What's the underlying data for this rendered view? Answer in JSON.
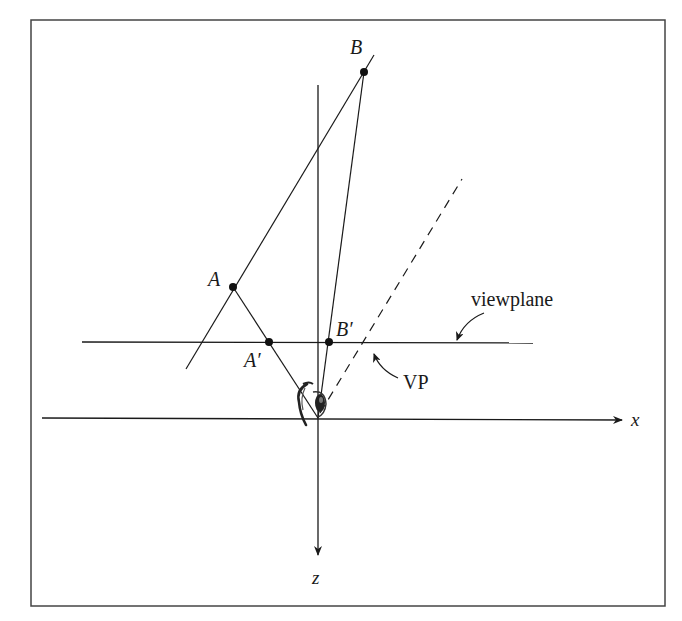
{
  "figure": {
    "type": "perspective projection diagram (top view)",
    "colors": {
      "ink": "#1a1a1a",
      "frame": "#444444",
      "background": "#ffffff"
    }
  },
  "axes": {
    "x_label": "x",
    "z_label": "z"
  },
  "points": {
    "A": {
      "label": "A"
    },
    "B": {
      "label": "B"
    },
    "A_prime": {
      "label": "A′"
    },
    "B_prime": {
      "label": "B′"
    }
  },
  "annotations": {
    "viewplane": "viewplane",
    "vp": "VP"
  },
  "icons": {
    "eye": "eye-icon"
  }
}
